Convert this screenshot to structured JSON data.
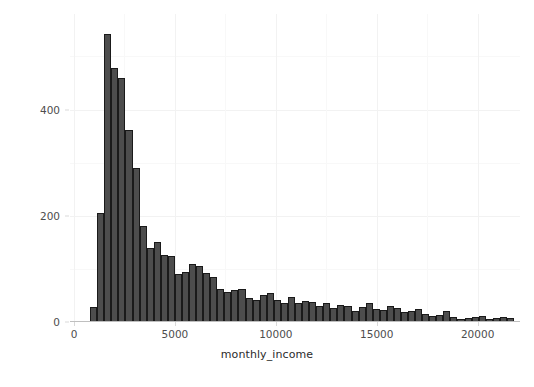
{
  "chart_data": {
    "type": "bar",
    "chart_subtype": "histogram",
    "title": "",
    "xlabel": "monthly_income",
    "ylabel": "count",
    "xlim": [
      -200,
      22100
    ],
    "ylim": [
      0,
      580
    ],
    "x_ticks": [
      0,
      5000,
      10000,
      15000,
      20000
    ],
    "x_tick_labels": [
      "0",
      "5000",
      "10000",
      "15000",
      "20000"
    ],
    "y_ticks": [
      0,
      200,
      400
    ],
    "y_tick_labels": [
      "0",
      "200",
      "400"
    ],
    "grid": true,
    "grid_minor": true,
    "legend": "none",
    "bin_width": 350,
    "bar_fill": "#4d4d4d",
    "bar_outline": "#1a1a1a",
    "panel_background": "#ffffff",
    "grid_color": "#f2f2f2",
    "bin_starts": [
      800,
      1150,
      1500,
      1850,
      2200,
      2550,
      2900,
      3250,
      3600,
      3950,
      4300,
      4650,
      5000,
      5350,
      5700,
      6050,
      6400,
      6750,
      7100,
      7450,
      7800,
      8150,
      8500,
      8850,
      9200,
      9550,
      9900,
      10250,
      10600,
      10950,
      11300,
      11650,
      12000,
      12350,
      12700,
      13050,
      13400,
      13750,
      14100,
      14450,
      14800,
      15150,
      15500,
      15850,
      16200,
      16550,
      16900,
      17250,
      17600,
      17950,
      18300,
      18650,
      19000,
      19350,
      19700,
      20050,
      20400,
      20750,
      21100,
      21450
    ],
    "bin_centers": [
      975,
      1325,
      1675,
      2025,
      2375,
      2725,
      3075,
      3425,
      3775,
      4125,
      4475,
      4825,
      5175,
      5525,
      5875,
      6225,
      6575,
      6925,
      7275,
      7625,
      7975,
      8325,
      8675,
      9025,
      9375,
      9725,
      10075,
      10425,
      10775,
      11125,
      11475,
      11825,
      12175,
      12525,
      12875,
      13225,
      13575,
      13925,
      14275,
      14625,
      14975,
      15325,
      15675,
      16025,
      16375,
      16725,
      17075,
      17425,
      17775,
      18125,
      18475,
      18825,
      19175,
      19525,
      19875,
      20225,
      20575,
      20925,
      21275,
      21625
    ],
    "categories": [
      "975",
      "1325",
      "1675",
      "2025",
      "2375",
      "2725",
      "3075",
      "3425",
      "3775",
      "4125",
      "4475",
      "4825",
      "5175",
      "5525",
      "5875",
      "6225",
      "6575",
      "6925",
      "7275",
      "7625",
      "7975",
      "8325",
      "8675",
      "9025",
      "9375",
      "9725",
      "10075",
      "10425",
      "10775",
      "11125",
      "11475",
      "11825",
      "12175",
      "12525",
      "12875",
      "13225",
      "13575",
      "13925",
      "14275",
      "14625",
      "14975",
      "15325",
      "15675",
      "16025",
      "16375",
      "16725",
      "17075",
      "17425",
      "17775",
      "18125",
      "18475",
      "18825",
      "19175",
      "19525",
      "19875",
      "20225",
      "20575",
      "20925",
      "21275",
      "21625"
    ],
    "values": [
      28,
      205,
      543,
      478,
      460,
      362,
      290,
      180,
      140,
      150,
      127,
      125,
      90,
      95,
      110,
      105,
      92,
      84,
      62,
      57,
      60,
      62,
      45,
      42,
      50,
      55,
      42,
      35,
      48,
      36,
      40,
      38,
      30,
      35,
      27,
      32,
      30,
      20,
      28,
      35,
      24,
      22,
      30,
      26,
      18,
      20,
      24,
      16,
      12,
      14,
      20,
      10,
      6,
      8,
      10,
      12,
      6,
      8,
      10,
      8
    ],
    "peak_value": 543,
    "peak_bin_center": 1675
  },
  "axes": {
    "y_title": "count",
    "x_title": "monthly_income"
  }
}
